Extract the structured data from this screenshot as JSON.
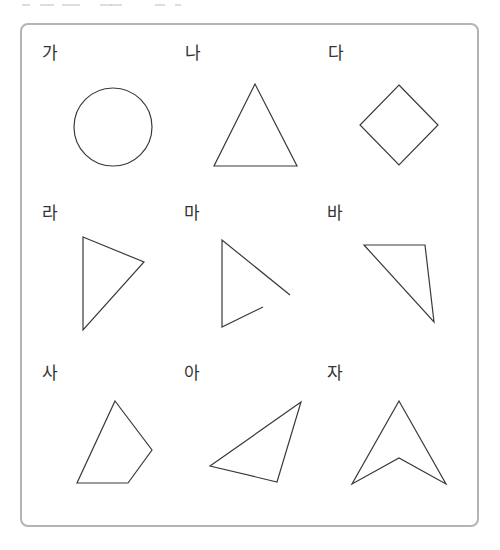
{
  "panel": {
    "border_color": "#b4b4b4",
    "stroke_color": "#3a3a3a",
    "items": [
      {
        "label": "가",
        "shape": "circle",
        "closed": true
      },
      {
        "label": "나",
        "shape": "triangle",
        "closed": true
      },
      {
        "label": "다",
        "shape": "square-rotated",
        "closed": true
      },
      {
        "label": "라",
        "shape": "triangle",
        "closed": true
      },
      {
        "label": "마",
        "shape": "open-polyline",
        "closed": false
      },
      {
        "label": "바",
        "shape": "triangle",
        "closed": true
      },
      {
        "label": "사",
        "shape": "quadrilateral",
        "closed": true
      },
      {
        "label": "아",
        "shape": "triangle",
        "closed": true
      },
      {
        "label": "자",
        "shape": "concave-quadrilateral",
        "closed": true
      }
    ]
  }
}
